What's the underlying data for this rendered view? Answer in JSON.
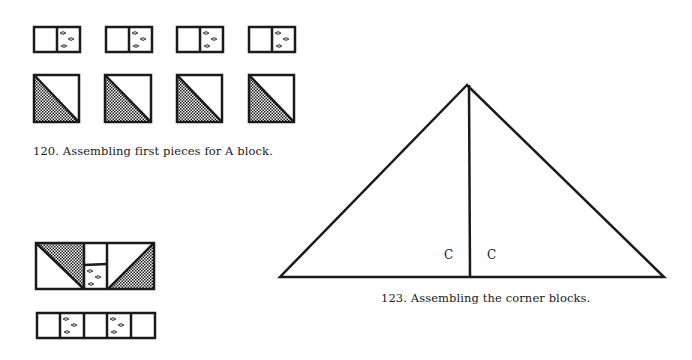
{
  "figures": {
    "fig120": {
      "caption": "120. Assembling first pieces for A block.",
      "rows": [
        {
          "type": "rectangle-pair",
          "count": 4,
          "description": "plain square joined to floral-print square"
        },
        {
          "type": "half-square-triangle",
          "count": 4,
          "description": "square divided diagonally, lower-left half checkered"
        }
      ]
    },
    "fig_assembly": {
      "top_unit": "two half-square triangles flanking a plain square over a floral square",
      "strip": [
        "plain",
        "floral",
        "plain",
        "floral",
        "plain"
      ]
    },
    "fig123": {
      "caption": "123. Assembling the corner blocks.",
      "labels": [
        "C",
        "C"
      ]
    }
  },
  "colors": {
    "ink": "#1a1a1a",
    "paper": "#ffffff"
  }
}
